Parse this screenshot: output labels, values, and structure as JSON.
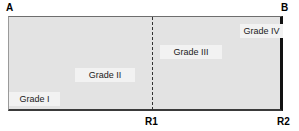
{
  "figure": {
    "type": "schematic-rectangle-diagram",
    "endpoints": {
      "top_left": "A",
      "top_right": "B",
      "bottom_divider": "R1",
      "bottom_right": "R2"
    },
    "regions": [
      {
        "id": "grade-1",
        "label": "Grade I"
      },
      {
        "id": "grade-2",
        "label": "Grade II"
      },
      {
        "id": "grade-3",
        "label": "Grade III"
      },
      {
        "id": "grade-4",
        "label": "Grade IV"
      }
    ],
    "colors": {
      "panel_fill": "#e3e3e3",
      "chip_fill": "#f2f2f2",
      "border_dark": "#111111",
      "divider": "#333333",
      "text": "#000000",
      "background": "#ffffff"
    }
  }
}
